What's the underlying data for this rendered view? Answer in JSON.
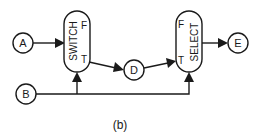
{
  "diagram": {
    "caption": "(b)",
    "nodes": {
      "a": {
        "label": "A",
        "shape": "circle"
      },
      "b": {
        "label": "B",
        "shape": "circle"
      },
      "d": {
        "label": "D",
        "shape": "circle"
      },
      "e": {
        "label": "E",
        "shape": "circle"
      }
    },
    "boxes": {
      "switch": {
        "label": "SWITCH",
        "port_false": "F",
        "port_true": "T"
      },
      "select": {
        "label": "SELECT",
        "port_false": "F",
        "port_true": "T"
      }
    },
    "edges": [
      {
        "from": "A",
        "to": "SWITCH"
      },
      {
        "from": "SWITCH.T",
        "to": "D"
      },
      {
        "from": "D",
        "to": "SELECT.T"
      },
      {
        "from": "SELECT",
        "to": "E"
      },
      {
        "from": "B",
        "to": "SWITCH (control)"
      },
      {
        "from": "B",
        "to": "SELECT (control)"
      }
    ],
    "colors": {
      "stroke": "#1a1a1a",
      "background": "#ffffff"
    }
  }
}
